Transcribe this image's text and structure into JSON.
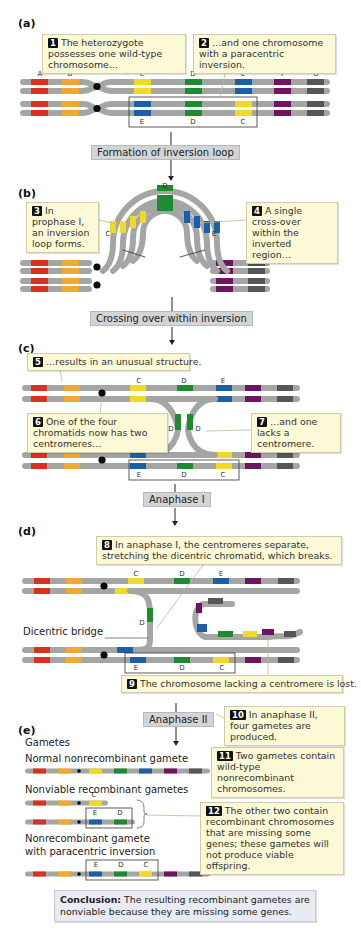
{
  "colors": {
    "A": "#d9301f",
    "B": "#efa832",
    "C": "#f2d925",
    "D": "#1f8a2f",
    "E": "#1c5fa6",
    "F": "#6e1460",
    "G": "#555658",
    "chromosome": "#a4a6a4",
    "centromere": "#0a0a0a",
    "callout_bg": "#fbf9d6",
    "step_bg": "#d3d4d6",
    "conclusion_bg": "#e8ebf3"
  },
  "gene_labels": [
    "A",
    "B",
    "C",
    "D",
    "E",
    "F",
    "G"
  ],
  "panels": {
    "a": {
      "label": "(a)",
      "callouts": [
        {
          "num": "1",
          "text": "The heterozygote possesses one wild-type chromosome…"
        },
        {
          "num": "2",
          "text": "…and one chromosome with a paracentric inversion."
        }
      ],
      "inverted_labels": [
        "E",
        "D",
        "C"
      ]
    },
    "b": {
      "label": "(b)",
      "callouts": [
        {
          "num": "3",
          "text": "In prophase I, an inversion loop forms."
        },
        {
          "num": "4",
          "text": "A single cross-over within the inverted region…"
        }
      ],
      "loop_labels": [
        "C",
        "D",
        "E"
      ]
    },
    "c": {
      "label": "(c)",
      "callouts": [
        {
          "num": "5",
          "text": "…results in an unusual structure."
        },
        {
          "num": "6",
          "text": "One of the four chromatids now has two centromeres…"
        },
        {
          "num": "7",
          "text": "…and one lacks a centromere."
        }
      ],
      "top_labels": [
        "C",
        "D",
        "E"
      ],
      "bridge_labels": [
        "D",
        "D"
      ],
      "bottom_labels": [
        "E",
        "D",
        "C"
      ]
    },
    "d": {
      "label": "(d)",
      "callouts": [
        {
          "num": "8",
          "text": "In anaphase I, the centromeres separate, stretching the dicentric chromatid, which breaks."
        },
        {
          "num": "9",
          "text": "The chromosome lacking a centromere is lost."
        }
      ],
      "bridge_label": "Dicentric bridge",
      "top_labels": [
        "C",
        "D",
        "E"
      ],
      "bridge_gene": "D",
      "bottom_labels": [
        "E",
        "D",
        "C"
      ]
    },
    "e": {
      "label": "(e)",
      "gametes_heading": "Gametes",
      "normal_title": "Normal nonrecombinant gamete",
      "nonviable_title": "Nonviable recombinant gametes",
      "nonviable_labels_1": [
        "C"
      ],
      "nonviable_labels_2": [
        "E",
        "D"
      ],
      "inversion_title_line1": "Nonrecombinant gamete",
      "inversion_title_line2": "with paracentric inversion",
      "inversion_labels": [
        "E",
        "D",
        "C"
      ],
      "callouts": [
        {
          "num": "10",
          "text": "In anaphase II, four gametes are produced."
        },
        {
          "num": "11",
          "text": "Two gametes contain wild-type nonrecombinant chromosomes."
        },
        {
          "num": "12",
          "text": "The other two contain recombinant chromosomes that are missing some genes; these gametes will not produce viable offspring."
        }
      ]
    }
  },
  "steps": {
    "s1": "Formation of inversion loop",
    "s2": "Crossing over within inversion",
    "s3": "Anaphase I",
    "s4": "Anaphase II"
  },
  "conclusion": {
    "label": "Conclusion:",
    "text": " The resulting recombinant gametes are nonviable because they are missing some genes."
  }
}
